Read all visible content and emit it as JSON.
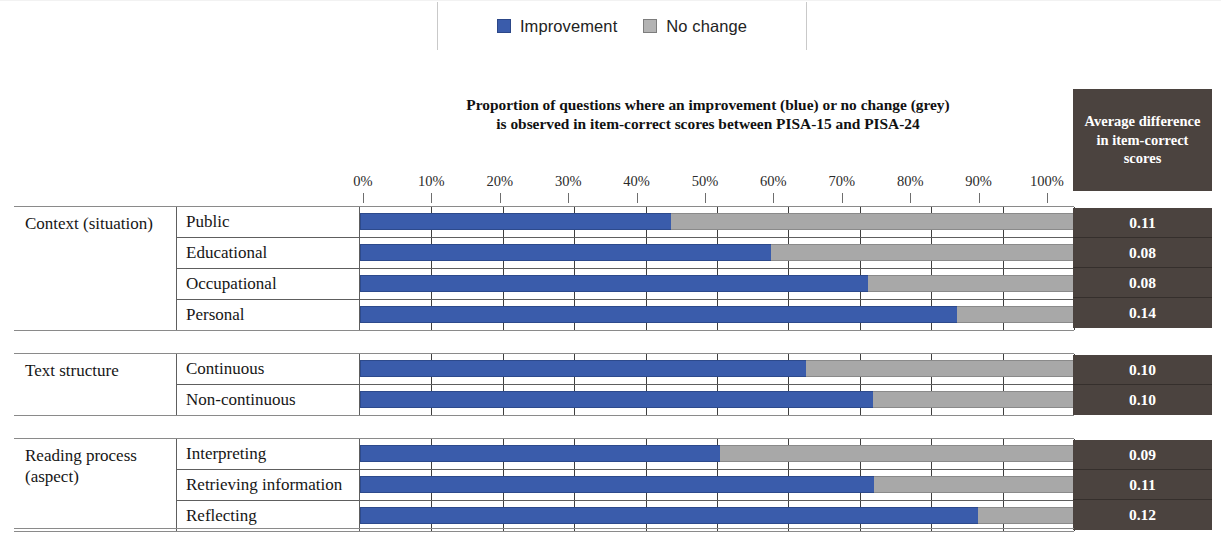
{
  "legend": {
    "items": [
      {
        "label": "Improvement",
        "color": "#3a5cab",
        "icon": "blue-square-swatch"
      },
      {
        "label": "No change",
        "color": "#a8a8a8",
        "icon": "grey-square-swatch"
      }
    ]
  },
  "chart_title_line1": "Proportion of questions where an improvement (blue) or no change (grey)",
  "chart_title_line2": "is observed in item-correct scores between PISA-15 and PISA-24",
  "avg_header": "Average difference in item-correct scores",
  "axis": {
    "ticks": [
      "0%",
      "10%",
      "20%",
      "30%",
      "40%",
      "50%",
      "60%",
      "70%",
      "80%",
      "90%",
      "100%"
    ]
  },
  "groups": [
    {
      "label": "Context (situation)",
      "rows": [
        {
          "label": "Public",
          "improvement": 43.6,
          "no_change": 56.4,
          "avg": "0.11"
        },
        {
          "label": "Educational",
          "improvement": 57.5,
          "no_change": 42.5,
          "avg": "0.08"
        },
        {
          "label": "Occupational",
          "improvement": 71.2,
          "no_change": 28.8,
          "avg": "0.08"
        },
        {
          "label": "Personal",
          "improvement": 83.6,
          "no_change": 16.4,
          "avg": "0.14"
        }
      ]
    },
    {
      "label": "Text structure",
      "rows": [
        {
          "label": "Continuous",
          "improvement": 62.4,
          "no_change": 37.6,
          "avg": "0.10"
        },
        {
          "label": "Non-continuous",
          "improvement": 71.9,
          "no_change": 28.1,
          "avg": "0.10"
        }
      ]
    },
    {
      "label": "Reading process (aspect)",
      "rows": [
        {
          "label": "Interpreting",
          "improvement": 50.4,
          "no_change": 49.6,
          "avg": "0.09"
        },
        {
          "label": "Retrieving information",
          "improvement": 72.0,
          "no_change": 28.0,
          "avg": "0.11"
        },
        {
          "label": "Reflecting",
          "improvement": 86.5,
          "no_change": 13.5,
          "avg": "0.12"
        }
      ]
    }
  ],
  "chart_data": {
    "type": "bar",
    "orientation": "horizontal",
    "stacked": true,
    "title": "Proportion of questions where an improvement (blue) or no change (grey) is observed in item-correct scores between PISA-15 and PISA-24",
    "xlabel": "",
    "ylabel": "",
    "xlim": [
      0,
      100
    ],
    "xtick_labels": [
      "0%",
      "10%",
      "20%",
      "30%",
      "40%",
      "50%",
      "60%",
      "70%",
      "80%",
      "90%",
      "100%"
    ],
    "grid": true,
    "legend_position": "top-center",
    "categories": [
      "Public",
      "Educational",
      "Occupational",
      "Personal",
      "Continuous",
      "Non-continuous",
      "Interpreting",
      "Retrieving information",
      "Reflecting"
    ],
    "category_groups": [
      {
        "group": "Context (situation)",
        "members": [
          "Public",
          "Educational",
          "Occupational",
          "Personal"
        ]
      },
      {
        "group": "Text structure",
        "members": [
          "Continuous",
          "Non-continuous"
        ]
      },
      {
        "group": "Reading process (aspect)",
        "members": [
          "Interpreting",
          "Retrieving information",
          "Reflecting"
        ]
      }
    ],
    "series": [
      {
        "name": "Improvement",
        "color": "#3a5cab",
        "values": [
          43.6,
          57.5,
          71.2,
          83.6,
          62.4,
          71.9,
          50.4,
          72.0,
          86.5
        ]
      },
      {
        "name": "No change",
        "color": "#a8a8a8",
        "values": [
          56.4,
          42.5,
          28.8,
          16.4,
          37.6,
          28.1,
          49.6,
          28.0,
          13.5
        ]
      }
    ],
    "annotation_column": {
      "header": "Average difference in item-correct scores",
      "values": [
        "0.11",
        "0.08",
        "0.08",
        "0.14",
        "0.10",
        "0.10",
        "0.09",
        "0.11",
        "0.12"
      ]
    }
  }
}
